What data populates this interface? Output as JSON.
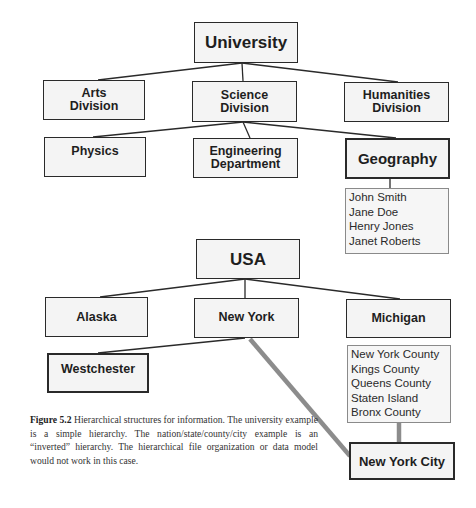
{
  "university_tree": {
    "root": "University",
    "divisions": [
      {
        "line1": "Arts",
        "line2": "Division"
      },
      {
        "line1": "Science",
        "line2": "Division"
      },
      {
        "line1": "Humanities",
        "line2": "Division"
      }
    ],
    "departments": [
      {
        "line1": "Physics"
      },
      {
        "line1": "Engineering",
        "line2": "Department"
      },
      {
        "line1": "Geography"
      }
    ],
    "geography_people": [
      "John Smith",
      "Jane Doe",
      "Henry Jones",
      "Janet Roberts"
    ]
  },
  "usa_tree": {
    "root": "USA",
    "states": [
      "Alaska",
      "New York",
      "Michigan"
    ],
    "new_york_children": [
      "Westchester"
    ],
    "counties": [
      "New York County",
      "Kings County",
      "Queens County",
      "Staten Island",
      "Bronx County"
    ],
    "city": "New York City"
  },
  "caption": {
    "label": "Figure 5.2",
    "text": "Hierarchical structures for information. The university example is a simple hierarchy. The nation/state/county/city example is an “inverted” hierarchy. The hierarchical file organization or data model would not work in this case."
  },
  "colors": {
    "box_border": "#2a2a2a",
    "box_fill": "#f4f4f4",
    "thin_line": "#2a2a2a",
    "thick_link": "#8c8c8c"
  }
}
